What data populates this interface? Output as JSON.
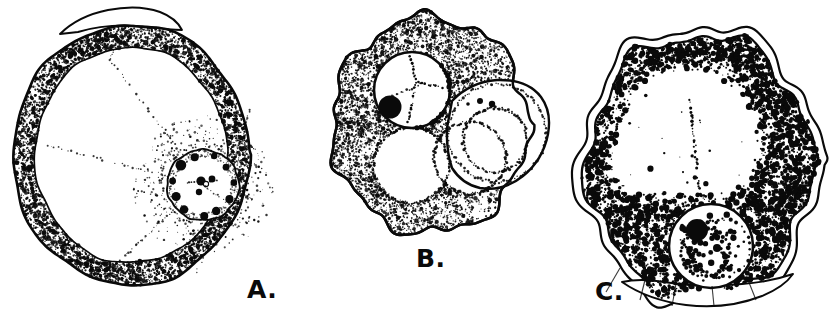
{
  "figure": {
    "title": "",
    "caption": "",
    "background_color": "#ffffff",
    "ink_color": "#0a0a0a",
    "medium": "line-drawing-stipple"
  },
  "panels": [
    {
      "id": "A",
      "label": "A.",
      "label_position": {
        "x": 247,
        "y": 277
      },
      "description": "round cell with thick stippled cortical ring, clear endoplasm with faint radiating dotted lines, and a round nucleus with peripheral black chromatin granules and a central karyosome",
      "cell": {
        "shape": "round",
        "center": {
          "x": 131,
          "y": 155
        },
        "radius_x": 118,
        "radius_y": 130,
        "cortex_band_width": 22,
        "cortex_texture": "coarse-stipple",
        "pseudopod": {
          "position": "top",
          "label": "hyaline pseudopod"
        }
      },
      "nucleus": {
        "center": {
          "x": 203,
          "y": 185
        },
        "radius": 36,
        "outline": "solid-ring",
        "karyosome": {
          "position": "central",
          "size": "small",
          "color": "#0a0a0a"
        },
        "peripheral_chromatin_granules": 11,
        "granule_color": "#0a0a0a"
      },
      "vacuoles": []
    },
    {
      "id": "B",
      "label": "B.",
      "label_position": {
        "x": 416,
        "y": 246
      },
      "description": "irregular amoeboid cell with heavily stippled cytoplasm, a nucleus with a large solid black nucleolus at lower left, and three large dotted-outline vacuoles in the lower half",
      "cell": {
        "shape": "irregular-lobed",
        "center": {
          "x": 430,
          "y": 125
        },
        "radius_x": 98,
        "radius_y": 108,
        "cortex_texture": "dense-fine-stipple",
        "pseudopod": {
          "position": "right",
          "label": "clear pseudopod lobe"
        }
      },
      "nucleus": {
        "center": {
          "x": 412,
          "y": 90
        },
        "radius": 38,
        "outline": "solid-ring",
        "karyosome": {
          "position": "lower-left",
          "size": "large",
          "color": "#0a0a0a"
        },
        "peripheral_chromatin_granules": 0,
        "granule_color": "#0a0a0a"
      },
      "vacuoles": [
        {
          "center": {
            "x": 411,
            "y": 165
          },
          "radius": 38,
          "outline": "dotted"
        },
        {
          "center": {
            "x": 470,
            "y": 158
          },
          "radius": 36,
          "outline": "dotted"
        },
        {
          "center": {
            "x": 495,
            "y": 140
          },
          "radius": 32,
          "outline": "dotted"
        }
      ]
    },
    {
      "id": "C",
      "label": "C.",
      "label_position": {
        "x": 595,
        "y": 279
      },
      "description": "large cell with a double outline (outer hyaline ectoplasm layer), coarse black granules concentrated along the upper-right rim and the lower-left region, a clear central vacuole, and a nucleus low-center with a big black nucleolus and many chromatin dots",
      "cell": {
        "shape": "irregular-angular",
        "center": {
          "x": 700,
          "y": 165
        },
        "radius_x": 112,
        "radius_y": 130,
        "cortex_texture": "coarse-black-granules",
        "outer_hyaline_layer": true,
        "pseudopod": {
          "position": "bottom",
          "label": "hyaline pseudopod"
        }
      },
      "nucleus": {
        "center": {
          "x": 711,
          "y": 246
        },
        "radius": 42,
        "outline": "solid-ring",
        "karyosome": {
          "position": "upper-left",
          "size": "large",
          "color": "#0a0a0a"
        },
        "peripheral_chromatin_granules": 22,
        "granule_color": "#0a0a0a"
      },
      "vacuoles": [
        {
          "center": {
            "x": 683,
            "y": 140
          },
          "radius": 74,
          "outline": "faint-dotted"
        }
      ]
    }
  ]
}
